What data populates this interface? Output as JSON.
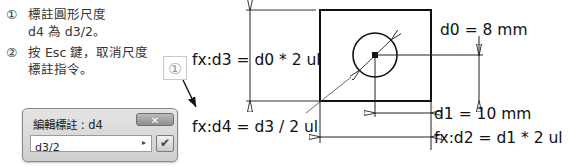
{
  "instructions": {
    "steps": [
      {
        "number": "①",
        "lines": [
          "標註圓形尺度",
          "d4 為 d3/2。"
        ]
      },
      {
        "number": "②",
        "lines": [
          "按 Esc 鍵，取消尺度",
          "標註指令。"
        ]
      }
    ]
  },
  "callout": {
    "label": "①"
  },
  "drawing": {
    "dimensions": {
      "d0": "d0 = 8 mm",
      "d1": "d1 = 10 mm",
      "d2": "fx:d2 = d1 * 2 ul",
      "d3": "fx:d3 = d0 * 2 ul",
      "d4": "fx:d4 = d3 / 2 ul"
    },
    "colors": {
      "line": "#111111",
      "thin": "#333333"
    }
  },
  "dialog": {
    "title": "編輯標註 : d4",
    "close_label": "✕",
    "input_value": "d3/2",
    "arrow_icon": "▸",
    "ok_icon": "✔"
  }
}
